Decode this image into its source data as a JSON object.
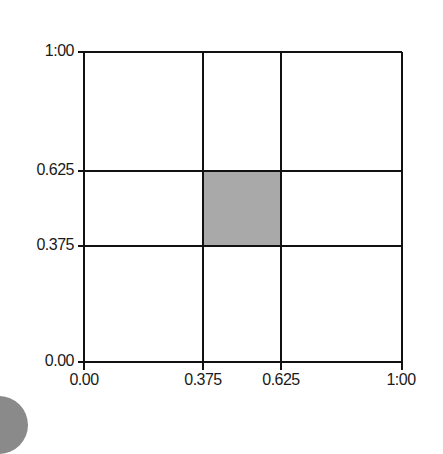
{
  "diagram": {
    "type": "unit-square-grid",
    "x_axis": {
      "ticks": [
        "0.00",
        "0.375",
        "0.625",
        "1:00"
      ],
      "values": [
        0,
        0.375,
        0.625,
        1.0
      ]
    },
    "y_axis": {
      "ticks": [
        "0.00",
        "0.375",
        "0.625",
        "1:00"
      ],
      "values": [
        0,
        0.375,
        0.625,
        1.0
      ]
    },
    "shaded_region": {
      "x": [
        0.375,
        0.625
      ],
      "y": [
        0.375,
        0.625
      ],
      "color": "#a9a9a9"
    },
    "line_color": "#111111",
    "background": "#ffffff"
  }
}
